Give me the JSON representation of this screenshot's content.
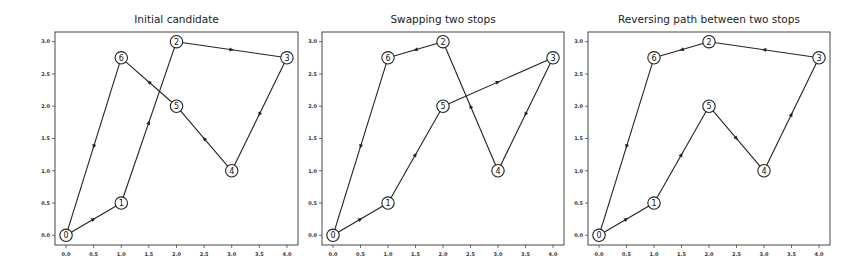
{
  "chart_data": [
    {
      "type": "line",
      "title": "Initial candidate",
      "xlabel": "",
      "ylabel": "",
      "xlim": [
        -0.2,
        4.2
      ],
      "ylim": [
        -0.15,
        3.15
      ],
      "xticks": [
        "0.0",
        "0.5",
        "1.0",
        "1.5",
        "2.0",
        "2.5",
        "3.0",
        "3.5",
        "4.0"
      ],
      "yticks": [
        "0.0",
        "0.5",
        "1.0",
        "1.5",
        "2.0",
        "2.5",
        "3.0"
      ],
      "grid": false,
      "legend": null,
      "nodes": [
        {
          "id": "0",
          "x": 0,
          "y": 0
        },
        {
          "id": "1",
          "x": 1,
          "y": 0.5
        },
        {
          "id": "2",
          "x": 2,
          "y": 3
        },
        {
          "id": "3",
          "x": 4,
          "y": 2.75
        },
        {
          "id": "4",
          "x": 3,
          "y": 1
        },
        {
          "id": "5",
          "x": 2,
          "y": 2
        },
        {
          "id": "6",
          "x": 1,
          "y": 2.75
        }
      ],
      "route": [
        "0",
        "1",
        "2",
        "3",
        "4",
        "5",
        "6",
        "0"
      ]
    },
    {
      "type": "line",
      "title": "Swapping two stops",
      "xlabel": "",
      "ylabel": "",
      "xlim": [
        -0.2,
        4.2
      ],
      "ylim": [
        -0.15,
        3.15
      ],
      "xticks": [
        "0.0",
        "0.5",
        "1.0",
        "1.5",
        "2.0",
        "2.5",
        "3.0",
        "3.5",
        "4.0"
      ],
      "yticks": [
        "0.0",
        "0.5",
        "1.0",
        "1.5",
        "2.0",
        "2.5",
        "3.0"
      ],
      "grid": false,
      "legend": null,
      "nodes": [
        {
          "id": "0",
          "x": 0,
          "y": 0
        },
        {
          "id": "1",
          "x": 1,
          "y": 0.5
        },
        {
          "id": "2",
          "x": 2,
          "y": 3
        },
        {
          "id": "3",
          "x": 4,
          "y": 2.75
        },
        {
          "id": "4",
          "x": 3,
          "y": 1
        },
        {
          "id": "5",
          "x": 2,
          "y": 2
        },
        {
          "id": "6",
          "x": 1,
          "y": 2.75
        }
      ],
      "route": [
        "0",
        "1",
        "5",
        "3",
        "4",
        "2",
        "6",
        "0"
      ]
    },
    {
      "type": "line",
      "title": "Reversing path between two stops",
      "xlabel": "",
      "ylabel": "",
      "xlim": [
        -0.2,
        4.2
      ],
      "ylim": [
        -0.15,
        3.15
      ],
      "xticks": [
        "0.0",
        "0.5",
        "1.0",
        "1.5",
        "2.0",
        "2.5",
        "3.0",
        "3.5",
        "4.0"
      ],
      "yticks": [
        "0.0",
        "0.5",
        "1.0",
        "1.5",
        "2.0",
        "2.5",
        "3.0"
      ],
      "grid": false,
      "legend": null,
      "nodes": [
        {
          "id": "0",
          "x": 0,
          "y": 0
        },
        {
          "id": "1",
          "x": 1,
          "y": 0.5
        },
        {
          "id": "2",
          "x": 2,
          "y": 3
        },
        {
          "id": "3",
          "x": 4,
          "y": 2.75
        },
        {
          "id": "4",
          "x": 3,
          "y": 1
        },
        {
          "id": "5",
          "x": 2,
          "y": 2
        },
        {
          "id": "6",
          "x": 1,
          "y": 2.75
        }
      ],
      "route": [
        "0",
        "1",
        "5",
        "4",
        "3",
        "2",
        "6",
        "0"
      ]
    }
  ],
  "panels": [
    {
      "title": "Initial candidate"
    },
    {
      "title": "Swapping two stops"
    },
    {
      "title": "Reversing path between two stops"
    }
  ],
  "colors": {
    "line": "#222222",
    "frame": "#333333",
    "node_fill": "#ffffff",
    "background": "#ffffff"
  }
}
